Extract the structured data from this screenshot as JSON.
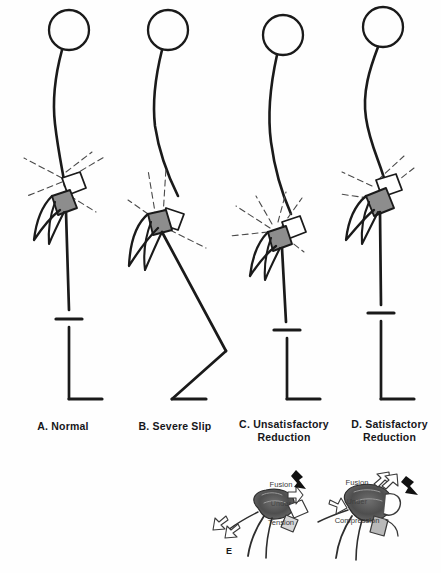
{
  "figure": {
    "background_color": "#fefefe",
    "ink_color": "#1a1a1a",
    "vertebra_fill": "#8d8d8d",
    "dashed_color": "#4a4a4a"
  },
  "panels": [
    {
      "id": "A",
      "letter": "A.",
      "name": "Normal",
      "caption": "A. Normal",
      "posture": "erect, straight legs, normal lumbosacral angle"
    },
    {
      "id": "B",
      "letter": "B.",
      "name": "Severe Slip",
      "caption": "B. Severe Slip",
      "posture": "flexed knees, hamstring tightness, pelvic retroversion"
    },
    {
      "id": "C",
      "letter": "C.",
      "name": "Unsatisfactory\nReduction",
      "caption": "C. Unsatisfactory\nReduction",
      "posture": "residual slip angle, straight leg"
    },
    {
      "id": "D",
      "letter": "D.",
      "name": "Satisfactory\nReduction",
      "caption": "D. Satisfactory\nReduction",
      "posture": "restored lordosis, straight leg"
    }
  ],
  "detail_panel": {
    "label": "E",
    "left": {
      "line1": "Fusion",
      "line2": "Under",
      "line3": "Tension"
    },
    "right": {
      "line1": "Fusion",
      "line2": "Under",
      "line3": "Compression"
    }
  }
}
